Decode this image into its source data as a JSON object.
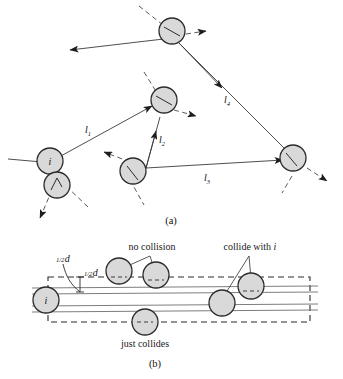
{
  "figure": {
    "panels": [
      {
        "id": "a",
        "caption": "(a)",
        "description": "zigzag free path of molecule i between collisions",
        "path_labels": [
          {
            "name": "l1",
            "base": "l",
            "sub": "1"
          },
          {
            "name": "l2",
            "base": "l",
            "sub": "2"
          },
          {
            "name": "l3",
            "base": "l",
            "sub": "3"
          },
          {
            "name": "l4",
            "base": "l",
            "sub": "4"
          }
        ],
        "particle_label": "i"
      },
      {
        "id": "b",
        "caption": "(b)",
        "description": "collision cylinder of molecule i",
        "particle_label": "i",
        "annotations": [
          {
            "name": "no-collision",
            "text": "no collision"
          },
          {
            "name": "collide-with-i",
            "text": "collide with ",
            "italic_suffix": "i"
          },
          {
            "name": "just-collides",
            "text": "just collides"
          }
        ],
        "dimension_labels": [
          {
            "name": "half-d-outer",
            "numerator": "1",
            "denominator": "2",
            "symbol": "d"
          },
          {
            "name": "half-d-inner",
            "numerator": "1",
            "denominator": "2",
            "symbol": "d"
          }
        ]
      }
    ]
  },
  "colors": {
    "molecule_fill": "#d9d9d9",
    "molecule_stroke": "#2b2b2b",
    "line": "#3a3a3a",
    "dashed": "#2b2b2b",
    "text": "#111111",
    "background": "#ffffff"
  }
}
